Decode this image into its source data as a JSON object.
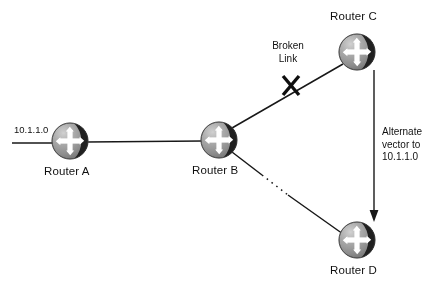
{
  "diagram": {
    "type": "network-topology",
    "background_color": "#ffffff",
    "line_color": "#1a1a1a",
    "router_body_color": "#9a9a9a",
    "router_shadow_color": "#1c1c1c",
    "router_glyph_color": "#ffffff",
    "nodes": [
      {
        "id": "router-a",
        "label": "Router A",
        "label_position": "below",
        "cx": 70,
        "cy": 141,
        "r": 18
      },
      {
        "id": "router-b",
        "label": "Router B",
        "label_position": "below",
        "cx": 219,
        "cy": 140,
        "r": 18
      },
      {
        "id": "router-c",
        "label": "Router C",
        "label_position": "above",
        "cx": 357,
        "cy": 52,
        "r": 18
      },
      {
        "id": "router-d",
        "label": "Router D",
        "label_position": "below",
        "cx": 357,
        "cy": 240,
        "r": 18
      }
    ],
    "network_label": "10.1.1.0",
    "links": [
      {
        "id": "link-stub-a",
        "from": "network-stub",
        "to": "router-a",
        "style": "solid"
      },
      {
        "id": "link-a-b",
        "from": "router-a",
        "to": "router-b",
        "style": "solid"
      },
      {
        "id": "link-b-c",
        "from": "router-b",
        "to": "router-c",
        "style": "solid",
        "status": "broken"
      },
      {
        "id": "link-b-d",
        "from": "router-b",
        "to": "router-d",
        "style": "solid-with-dotted-segment"
      },
      {
        "id": "link-c-d-vector",
        "from": "router-c",
        "to": "router-d",
        "style": "arrow-down"
      }
    ],
    "annotations": {
      "broken_link": {
        "line1": "Broken",
        "line2": "Link",
        "marker": "X"
      },
      "alternate_vector": {
        "line1": "Alternate",
        "line2": "vector to",
        "line3": "10.1.1.0"
      }
    }
  }
}
